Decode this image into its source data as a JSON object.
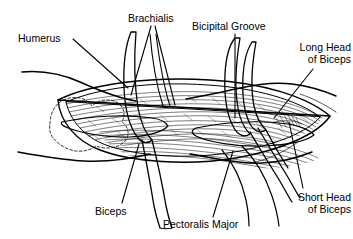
{
  "figure": {
    "kind": "anatomical-line-drawing",
    "title_visible": "",
    "stroke_color": "#000000",
    "background_color": "#ffffff",
    "bone_outline_style": "dashed",
    "labels": [
      {
        "id": "humerus",
        "text": "Humerus",
        "x": 18,
        "y": 33,
        "align": "left",
        "leader": {
          "type": "line",
          "points": [
            [
              73,
              39
            ],
            [
              128,
              88
            ]
          ]
        }
      },
      {
        "id": "brachialis",
        "text": "Brachialis",
        "x": 128,
        "y": 13,
        "align": "left",
        "leader": {
          "type": "multi",
          "points": [
            [
              [
                151,
                26
              ],
              [
                131,
                95
              ]
            ],
            [
              [
                155,
                26
              ],
              [
                175,
                105
              ]
            ]
          ]
        }
      },
      {
        "id": "bicipital-groove",
        "text": "Bicipital Groove",
        "x": 192,
        "y": 21,
        "align": "left",
        "leader": {
          "type": "line",
          "points": [
            [
              235,
              34
            ],
            [
              235,
              118
            ]
          ]
        }
      },
      {
        "id": "long-head-of-biceps",
        "text": "Long Head\nof Biceps",
        "x": 281,
        "y": 42,
        "align": "right",
        "leader": {
          "type": "line",
          "points": [
            [
              313,
              69
            ],
            [
              274,
              118
            ]
          ]
        }
      },
      {
        "id": "short-head-of-biceps",
        "text": "Short Head\nof Biceps",
        "x": 280,
        "y": 192,
        "align": "right",
        "leader": {
          "type": "line",
          "points": [
            [
              303,
              188
            ],
            [
              289,
              122
            ]
          ]
        }
      },
      {
        "id": "pectoralis-major",
        "text": "Pectoralis Major",
        "x": 163,
        "y": 219,
        "align": "left",
        "leader": {
          "type": "line",
          "points": [
            [
              213,
              217
            ],
            [
              233,
              151
            ]
          ]
        }
      },
      {
        "id": "biceps",
        "text": "Biceps",
        "x": 95,
        "y": 206,
        "align": "left",
        "leader": {
          "type": "line",
          "points": [
            [
              122,
              203
            ],
            [
              139,
              144
            ]
          ]
        }
      }
    ],
    "structures": [
      {
        "id": "arm-outline-upper",
        "name": "upper arm contour"
      },
      {
        "id": "arm-outline-lower",
        "name": "lower arm contour"
      },
      {
        "id": "humerus-bone",
        "name": "humerus head dashed outline"
      },
      {
        "id": "dissection-field",
        "name": "open muscle dissection window"
      },
      {
        "id": "muscle-hatching",
        "name": "muscle fiber hatching"
      },
      {
        "id": "biceps-tendon-long",
        "name": "long head of biceps tendon"
      },
      {
        "id": "biceps-tendon-short",
        "name": "short head of biceps tendon"
      },
      {
        "id": "retractor-band-left",
        "name": "retracted muscle band left"
      },
      {
        "id": "retractor-band-right",
        "name": "retracted muscle band right"
      }
    ]
  }
}
